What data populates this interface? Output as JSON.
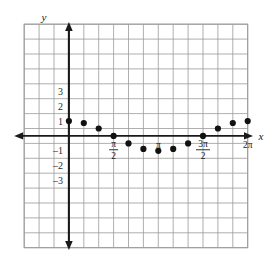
{
  "chart_data": {
    "type": "scatter",
    "title": "",
    "subtitle": "",
    "xlabel": "x",
    "ylabel": "y",
    "grid": true,
    "legend": "none",
    "xlim": [
      -3,
      12
    ],
    "ylim": [
      -4.2,
      4.2
    ],
    "x_tick_labels": [
      {
        "value": 1.5708,
        "text": "π/2",
        "numerator": "π",
        "denominator": "2",
        "is_fraction": true
      },
      {
        "value": 3.1416,
        "text": "π",
        "numerator": "π",
        "denominator": "",
        "is_fraction": false
      },
      {
        "value": 4.7124,
        "text": "3π/2",
        "numerator": "3π",
        "denominator": "2",
        "is_fraction": true
      },
      {
        "value": 6.2832,
        "text": "2π",
        "numerator": "2π",
        "denominator": "",
        "is_fraction": false
      }
    ],
    "y_tick_labels": [
      {
        "value": 3,
        "text": "3"
      },
      {
        "value": 2,
        "text": "2"
      },
      {
        "value": 1,
        "text": "1"
      },
      {
        "value": -1,
        "text": "-1"
      },
      {
        "value": -2,
        "text": "-2"
      },
      {
        "value": -3,
        "text": "-3"
      }
    ],
    "series": [
      {
        "name": "cos(x)",
        "points": [
          {
            "x": 0.0,
            "y": 1.0
          },
          {
            "x": 0.5236,
            "y": 0.87
          },
          {
            "x": 1.0472,
            "y": 0.5
          },
          {
            "x": 1.5708,
            "y": 0.0
          },
          {
            "x": 2.0944,
            "y": -0.5
          },
          {
            "x": 2.618,
            "y": -0.87
          },
          {
            "x": 3.1416,
            "y": -1.0
          },
          {
            "x": 3.665,
            "y": -0.87
          },
          {
            "x": 4.1888,
            "y": -0.5
          },
          {
            "x": 4.7124,
            "y": 0.0
          },
          {
            "x": 5.236,
            "y": 0.5
          },
          {
            "x": 5.76,
            "y": 0.87
          },
          {
            "x": 6.2832,
            "y": 1.0
          }
        ]
      }
    ],
    "colors": {
      "point": "#111111",
      "axis": "#1a1a1a",
      "grid": "#9a9a9a",
      "background": "#ffffff"
    }
  }
}
